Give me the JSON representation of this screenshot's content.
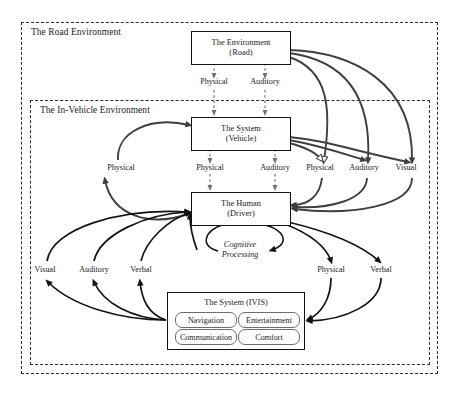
{
  "diagram": {
    "containers": [
      {
        "id": "road",
        "label": "The Road Environment"
      },
      {
        "id": "invehicle",
        "label": "The In-Vehicle Environment"
      }
    ],
    "nodes": {
      "environment": {
        "line1": "The Environment",
        "line2": "(Road)"
      },
      "vehicle": {
        "line1": "The System",
        "line2": "(Vehicle)"
      },
      "human": {
        "line1": "The Human",
        "line2": "(Driver)"
      },
      "ivis": {
        "title": "The System (IVIS)",
        "features": [
          "Navigation",
          "Entertainment",
          "Communication",
          "Comfort"
        ]
      }
    },
    "cognitive_label": {
      "line1": "Cognitive",
      "line2": "Processing"
    },
    "edge_labels_upper": [
      {
        "text": "Physical",
        "x": 121
      },
      {
        "text": "Physical",
        "x": 210
      },
      {
        "text": "Auditory",
        "x": 275
      },
      {
        "text": "Physical",
        "x": 320
      },
      {
        "text": "Auditory",
        "x": 364
      },
      {
        "text": "Visual",
        "x": 406
      }
    ],
    "edge_labels_mid": [
      {
        "text": "Physical",
        "x": 210
      },
      {
        "text": "Auditory",
        "x": 275
      }
    ],
    "edge_labels_lower": [
      {
        "text": "Visual",
        "x": 45
      },
      {
        "text": "Auditory",
        "x": 94
      },
      {
        "text": "Verbal",
        "x": 141
      },
      {
        "text": "Physical",
        "x": 331
      },
      {
        "text": "Verbal",
        "x": 381
      }
    ],
    "colors": {
      "stroke": "#121212",
      "dashed_border": "#2b2b2b",
      "gray_arrow": "#3f3f3f",
      "pill_border": "#6d6d6d",
      "background": "#ffffff"
    }
  }
}
